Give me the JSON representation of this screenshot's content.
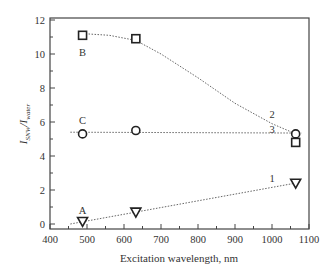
{
  "chart_data": {
    "type": "line",
    "title": "",
    "xlabel": "Excitation wavelength, nm",
    "ylabel": "I_SNW / I_water",
    "ylabel_main": "I",
    "ylabel_sub1": "SNW",
    "ylabel_slash": "/",
    "ylabel_sub2": "water",
    "xlim": [
      400,
      1100
    ],
    "ylim": [
      -0.3,
      12
    ],
    "xticks": [
      400,
      500,
      600,
      700,
      800,
      900,
      1000,
      1100
    ],
    "yticks": [
      0,
      2,
      4,
      6,
      8,
      10,
      12
    ],
    "grid": false,
    "legend": "none (inline annotations)",
    "series": [
      {
        "name": "A",
        "marker": "triangle-down",
        "curve_label": "1",
        "x": [
          488,
          632,
          1064
        ],
        "y": [
          0.15,
          0.7,
          2.4
        ]
      },
      {
        "name": "B",
        "marker": "square",
        "curve_label": "2",
        "x": [
          488,
          632,
          1064
        ],
        "y": [
          11.1,
          10.9,
          4.8
        ]
      },
      {
        "name": "C",
        "marker": "circle",
        "curve_label": "3",
        "x": [
          488,
          632,
          1064
        ],
        "y": [
          5.3,
          5.5,
          5.3
        ]
      }
    ],
    "fit_lines": [
      {
        "label": "1",
        "type": "linear",
        "x": [
          455,
          1075
        ],
        "y": [
          0.0,
          2.45
        ]
      },
      {
        "label": "2",
        "type": "smooth",
        "x": [
          488,
          560,
          632,
          700,
          800,
          900,
          1000,
          1075
        ],
        "y": [
          11.2,
          11.1,
          10.8,
          10.0,
          8.6,
          7.1,
          5.9,
          5.2
        ]
      },
      {
        "label": "3",
        "type": "flat",
        "x": [
          455,
          1080
        ],
        "y": [
          5.4,
          5.35
        ]
      }
    ],
    "annotations": [
      {
        "text": "A",
        "x": 488,
        "y": 0.8
      },
      {
        "text": "B",
        "x": 488,
        "y": 10.1
      },
      {
        "text": "C",
        "x": 488,
        "y": 6.1
      },
      {
        "text": "1",
        "x": 1000,
        "y": 2.7
      },
      {
        "text": "2",
        "x": 1000,
        "y": 6.5
      },
      {
        "text": "3",
        "x": 1000,
        "y": 5.6
      }
    ]
  }
}
